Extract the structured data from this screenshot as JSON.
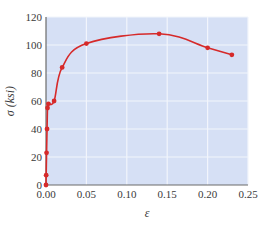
{
  "chart_data": {
    "type": "line",
    "title": "",
    "xlabel": "ε",
    "ylabel": "σ (ksi)",
    "xlim": [
      0,
      0.25
    ],
    "ylim": [
      0,
      120
    ],
    "grid": true,
    "legend": null,
    "x_ticks": [
      "0.00",
      "0.05",
      "0.10",
      "0.15",
      "0.20",
      "0.25"
    ],
    "y_ticks": [
      "0",
      "20",
      "40",
      "60",
      "80",
      "100",
      "120"
    ],
    "series": [
      {
        "name": "stress-strain",
        "color": "#d62a2a",
        "points": [
          {
            "x": 0.0,
            "y": 0
          },
          {
            "x": 0.0002,
            "y": 7
          },
          {
            "x": 0.0007,
            "y": 23
          },
          {
            "x": 0.0013,
            "y": 40
          },
          {
            "x": 0.0019,
            "y": 55
          },
          {
            "x": 0.003,
            "y": 58
          },
          {
            "x": 0.01,
            "y": 60
          },
          {
            "x": 0.02,
            "y": 84
          },
          {
            "x": 0.05,
            "y": 101
          },
          {
            "x": 0.14,
            "y": 108
          },
          {
            "x": 0.2,
            "y": 98
          },
          {
            "x": 0.23,
            "y": 93
          }
        ]
      }
    ]
  },
  "colors": {
    "plot_background": "#d6e0f5",
    "grid": "#f2f5fc",
    "axis": "#6b6b6b",
    "series": "#d62a2a"
  }
}
